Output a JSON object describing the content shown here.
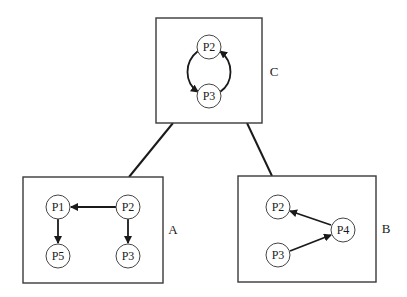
{
  "diagram": {
    "type": "hierarchical process graphs",
    "colors": {
      "line": "#1a1a1a",
      "box": "#3a3a3a",
      "node": "#444444",
      "background": "#ffffff"
    },
    "connections": [
      {
        "from": "C",
        "to": "A"
      },
      {
        "from": "C",
        "to": "B"
      }
    ],
    "groups": {
      "C": {
        "label": "C",
        "nodes": {
          "p2": "P2",
          "p3": "P3"
        },
        "edges": [
          {
            "from": "P2",
            "to": "P3",
            "side": "left"
          },
          {
            "from": "P3",
            "to": "P2",
            "side": "right"
          }
        ]
      },
      "A": {
        "label": "A",
        "nodes": {
          "p1": "P1",
          "p2": "P2",
          "p5": "P5",
          "p3": "P3"
        },
        "edges": [
          {
            "from": "P2",
            "to": "P1"
          },
          {
            "from": "P1",
            "to": "P5"
          },
          {
            "from": "P2",
            "to": "P3"
          }
        ]
      },
      "B": {
        "label": "B",
        "nodes": {
          "p2": "P2",
          "p3": "P3",
          "p4": "P4"
        },
        "edges": [
          {
            "from": "P4",
            "to": "P2"
          },
          {
            "from": "P3",
            "to": "P4"
          }
        ]
      }
    }
  }
}
